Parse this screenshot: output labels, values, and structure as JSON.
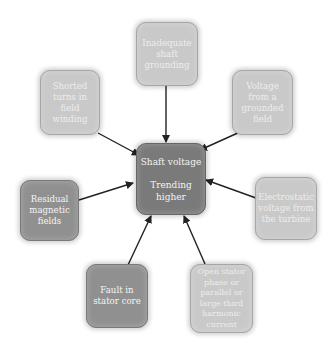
{
  "diagram": {
    "type": "radial cause diagram",
    "center": {
      "line1": "Shaft voltage",
      "line2": "Trending higher",
      "shade": "#7a7a7a"
    },
    "causes": [
      {
        "id": "inadequate-shaft-grounding",
        "label": "Inadequate shaft grounding",
        "shade": "#c9c9c9"
      },
      {
        "id": "voltage-from-grounded-field",
        "label": "Voltage from a grounded field",
        "shade": "#c9c9c9"
      },
      {
        "id": "electrostatic-voltage-turbine",
        "label": "Electrostatic voltage from the turbine",
        "shade": "#c9c9c9"
      },
      {
        "id": "open-stator-phase",
        "label": "Open stator phase or parallel or large third harmonic current",
        "shade": "#c9c9c9"
      },
      {
        "id": "fault-in-stator-core",
        "label": "Fault in stator core",
        "shade": "#909090"
      },
      {
        "id": "residual-magnetic-fields",
        "label": "Residual magnetic fields",
        "shade": "#909090"
      },
      {
        "id": "shorted-turns-field-winding",
        "label": "Shorted turns in field winding",
        "shade": "#c9c9c9"
      }
    ],
    "arrow_color": "#222222"
  }
}
